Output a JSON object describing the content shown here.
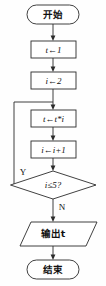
{
  "diagram": {
    "title": "",
    "type": "flowchart",
    "colors": {
      "stroke": "#2b2b2b",
      "fill": "#ffffff",
      "text": "#111111",
      "background": "#fefefe"
    },
    "nodes": [
      {
        "id": "start",
        "shape": "terminator",
        "text": "开始"
      },
      {
        "id": "init_t",
        "shape": "process",
        "text": "t←1"
      },
      {
        "id": "init_i",
        "shape": "process",
        "text": "i←2"
      },
      {
        "id": "mul",
        "shape": "process",
        "text": "t←t*i"
      },
      {
        "id": "incr",
        "shape": "process",
        "text": "i←i+1"
      },
      {
        "id": "decision",
        "shape": "decision",
        "text": "i≤5?"
      },
      {
        "id": "output",
        "shape": "parallelogram",
        "text": "输出t"
      },
      {
        "id": "end",
        "shape": "terminator",
        "text": "结束"
      }
    ],
    "branch_labels": {
      "yes": "Y",
      "no": "N"
    },
    "edges": [
      {
        "from": "start",
        "to": "init_t",
        "label": ""
      },
      {
        "from": "init_t",
        "to": "init_i",
        "label": ""
      },
      {
        "from": "init_i",
        "to": "mul",
        "label": ""
      },
      {
        "from": "mul",
        "to": "incr",
        "label": ""
      },
      {
        "from": "incr",
        "to": "decision",
        "label": ""
      },
      {
        "from": "decision",
        "to": "mul",
        "label": "Y"
      },
      {
        "from": "decision",
        "to": "output",
        "label": "N"
      },
      {
        "from": "output",
        "to": "end",
        "label": ""
      }
    ]
  }
}
